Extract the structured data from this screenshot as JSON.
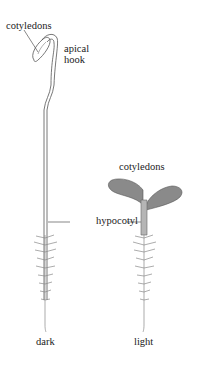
{
  "figure": {
    "labels": {
      "cotyledons_dark": "cotyledons",
      "apical": "apical",
      "hook": "hook",
      "cotyledons_light": "cotyledons",
      "hypocotyl": "hypocotyl",
      "dark": "dark",
      "light": "light"
    },
    "colors": {
      "outline": "#555555",
      "stem_fill": "#f4f4f4",
      "cotyledon_fill": "#8a8a8a",
      "light_stem_fill": "#b5b5b5",
      "root": "#888888",
      "text": "#222222"
    }
  }
}
